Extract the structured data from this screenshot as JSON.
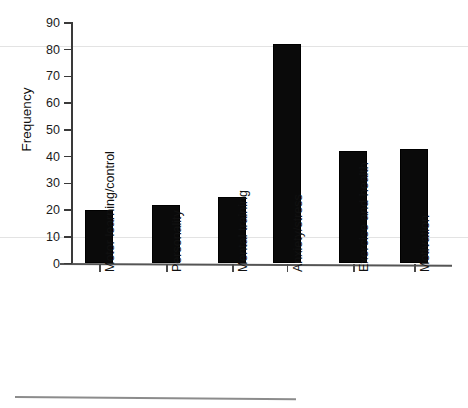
{
  "figure": {
    "cropped_header_text": "",
    "background_color": "#ffffff",
    "bar_color": "#0a0a0a",
    "axis_color": "#3a3a3a",
    "gridline_color": "#e3e3e3"
  },
  "chart_data": {
    "type": "bar",
    "title": "",
    "xlabel": "",
    "ylabel": "Frequency",
    "ylim": [
      0,
      90
    ],
    "ytick_step": 10,
    "yticks": [
      0,
      10,
      20,
      30,
      40,
      50,
      60,
      70,
      80,
      90
    ],
    "ytick_labels": [
      "0",
      "10",
      "20",
      "30",
      "40",
      "50",
      "60",
      "70",
      "80",
      "90"
    ],
    "grid": false,
    "legend": null,
    "categories": [
      "Motor learning/control",
      "Personality",
      "Mental training",
      "Anxiety/stress",
      "Exercise and health",
      "Motivation"
    ],
    "values": [
      20,
      22,
      25,
      82,
      42,
      43
    ],
    "series": [
      {
        "name": "Frequency",
        "values": [
          20,
          22,
          25,
          82,
          42,
          43
        ]
      }
    ],
    "annotations": []
  }
}
